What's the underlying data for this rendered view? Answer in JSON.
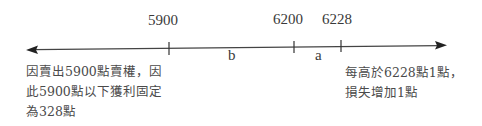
{
  "diagram": {
    "type": "number-line",
    "ticks": [
      {
        "label": "5900",
        "x": 169
      },
      {
        "label": "6200",
        "x": 294
      },
      {
        "label": "6228",
        "x": 341
      }
    ],
    "segments": [
      {
        "label": "b",
        "between": [
          "5900",
          "6200"
        ]
      },
      {
        "label": "a",
        "between": [
          "6200",
          "6228"
        ]
      }
    ],
    "left_note": {
      "lines": [
        "因賣出5900點賣權，因",
        "此5900點以下獲利固定",
        "為328點"
      ]
    },
    "right_note": {
      "lines": [
        "每高於6228點1點，",
        "損失增加1點"
      ]
    },
    "colors": {
      "line": "#333333",
      "text": "#3a3a3a"
    }
  }
}
